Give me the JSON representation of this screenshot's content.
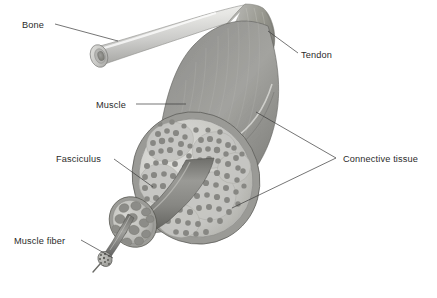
{
  "figure": {
    "background_color": "#ffffff",
    "width": 437,
    "height": 298
  },
  "labels": [
    {
      "id": "bone",
      "text": "Bone",
      "x": 22,
      "y": 28,
      "anchor": "start",
      "leader": "M 55 24 L 118 41"
    },
    {
      "id": "tendon",
      "text": "Tendon",
      "x": 301,
      "y": 58,
      "anchor": "start",
      "leader": "M 298 53 L 268 31"
    },
    {
      "id": "muscle",
      "text": "Muscle",
      "x": 96,
      "y": 108,
      "anchor": "start",
      "leader": "M 136 104 L 186 104"
    },
    {
      "id": "fasciculus",
      "text": "Fasciculus",
      "x": 56,
      "y": 162,
      "anchor": "start",
      "leader": "M 114 159 L 153 187"
    },
    {
      "id": "muscle-fiber",
      "text": "Muscle fiber",
      "x": 14,
      "y": 244,
      "anchor": "start",
      "leader": "M 81 240 L 113 258"
    },
    {
      "id": "connective-tissue",
      "text": "Connective tissue",
      "x": 343,
      "y": 162,
      "anchor": "start",
      "leader": "M 336 158 L 256 112 M 336 158 L 232 208"
    }
  ],
  "colors": {
    "bone_light": "#e8e8e6",
    "bone_mid": "#c9c9c6",
    "bone_dark": "#9a9a97",
    "marrow": "#8c8c8a",
    "tendon_light": "#b2b2ae",
    "tendon_mid": "#8f8f8c",
    "muscle_light": "#a9a9a5",
    "muscle_mid": "#8a8a86",
    "muscle_dark": "#6f6f6c",
    "endomysium": "#cfcfcb",
    "fiber_dot": "#8e8e8a",
    "outline": "#5a5a57",
    "label_text": "#2b2b2b",
    "leader_line": "#3a3a3a"
  },
  "structures": [
    {
      "id": "bone",
      "name": "Bone",
      "description": "Cut long bone shaft with cortical ring and marrow cavity"
    },
    {
      "id": "tendon",
      "name": "Tendon",
      "description": "Fan-shaped fibrous band joining bone to muscle"
    },
    {
      "id": "muscle",
      "name": "Muscle",
      "description": "Muscle belly shown in cross-section with many fascicles"
    },
    {
      "id": "fasciculus",
      "name": "Fasciculus",
      "description": "Bundle of muscle fibers pulled out from the muscle"
    },
    {
      "id": "muscle-fiber",
      "name": "Muscle fiber",
      "description": "Single muscle cell drawn out of the fasciculus"
    },
    {
      "id": "connective-tissue",
      "name": "Connective tissue",
      "description": "Epimysium and perimysium sheaths wrapping the muscle"
    }
  ]
}
